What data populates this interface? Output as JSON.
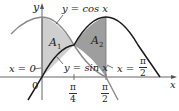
{
  "figure": {
    "axes": {
      "x_label": "x",
      "y_label": "y",
      "origin_label": "0"
    },
    "curves": [
      {
        "name": "cos",
        "label": "y = cos x",
        "color": "#8a8a8a"
      },
      {
        "name": "sin",
        "label": "y = sin x",
        "color": "#1a1a1a"
      }
    ],
    "regions": [
      {
        "name": "A1",
        "label_main": "A",
        "label_sub": "1",
        "fill": "#cfcfcf"
      },
      {
        "name": "A2",
        "label_main": "A",
        "label_sub": "2",
        "fill": "#9e9e9e"
      }
    ],
    "boundary_labels": {
      "left": "x = 0",
      "right_prefix": "x = ",
      "right_num": "π",
      "right_den": "2"
    },
    "ticks": [
      {
        "num": "π",
        "den": "4"
      },
      {
        "num": "π",
        "den": "2"
      }
    ],
    "colors": {
      "axis": "#555555",
      "region_a1": "#cfcfcf",
      "region_a2": "#9e9e9e"
    }
  }
}
